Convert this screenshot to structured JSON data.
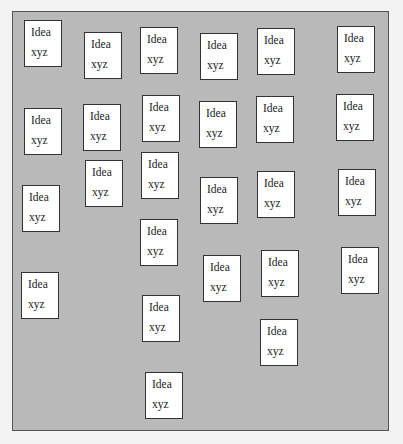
{
  "board": {
    "cards": [
      {
        "title": "Idea",
        "subtitle": "xyz",
        "x": 24,
        "y": 20
      },
      {
        "title": "Idea",
        "subtitle": "xyz",
        "x": 84,
        "y": 32
      },
      {
        "title": "Idea",
        "subtitle": "xyz",
        "x": 140,
        "y": 27
      },
      {
        "title": "Idea",
        "subtitle": "xyz",
        "x": 200,
        "y": 33
      },
      {
        "title": "Idea",
        "subtitle": "xyz",
        "x": 257,
        "y": 28
      },
      {
        "title": "Idea",
        "subtitle": "xyz",
        "x": 337,
        "y": 26
      },
      {
        "title": "Idea",
        "subtitle": "xyz",
        "x": 24,
        "y": 108
      },
      {
        "title": "Idea",
        "subtitle": "xyz",
        "x": 83,
        "y": 104
      },
      {
        "title": "Idea",
        "subtitle": "xyz",
        "x": 142,
        "y": 95
      },
      {
        "title": "Idea",
        "subtitle": "xyz",
        "x": 199,
        "y": 101
      },
      {
        "title": "Idea",
        "subtitle": "xyz",
        "x": 256,
        "y": 96
      },
      {
        "title": "Idea",
        "subtitle": "xyz",
        "x": 336,
        "y": 94
      },
      {
        "title": "Idea",
        "subtitle": "xyz",
        "x": 85,
        "y": 160
      },
      {
        "title": "Idea",
        "subtitle": "xyz",
        "x": 141,
        "y": 152
      },
      {
        "title": "Idea",
        "subtitle": "xyz",
        "x": 22,
        "y": 185
      },
      {
        "title": "Idea",
        "subtitle": "xyz",
        "x": 200,
        "y": 177
      },
      {
        "title": "Idea",
        "subtitle": "xyz",
        "x": 257,
        "y": 171
      },
      {
        "title": "Idea",
        "subtitle": "xyz",
        "x": 338,
        "y": 169
      },
      {
        "title": "Idea",
        "subtitle": "xyz",
        "x": 140,
        "y": 219
      },
      {
        "title": "Idea",
        "subtitle": "xyz",
        "x": 203,
        "y": 255
      },
      {
        "title": "Idea",
        "subtitle": "xyz",
        "x": 261,
        "y": 250
      },
      {
        "title": "Idea",
        "subtitle": "xyz",
        "x": 341,
        "y": 247
      },
      {
        "title": "Idea",
        "subtitle": "xyz",
        "x": 21,
        "y": 272
      },
      {
        "title": "Idea",
        "subtitle": "xyz",
        "x": 142,
        "y": 295
      },
      {
        "title": "Idea",
        "subtitle": "xyz",
        "x": 260,
        "y": 319
      },
      {
        "title": "Idea",
        "subtitle": "xyz",
        "x": 145,
        "y": 372
      }
    ]
  },
  "colors": {
    "board_background": "#b9b9b9",
    "card_background": "#ffffff",
    "card_border": "#333333"
  }
}
